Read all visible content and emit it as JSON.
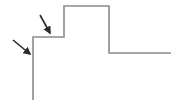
{
  "diagram": {
    "width": 183,
    "height": 109,
    "background": "#ffffff",
    "step_path": {
      "points": "33,100 33,37 64,37 64,6 109,6 109,53 171,53",
      "stroke": "#8a8a8a",
      "stroke_width": 1.6
    },
    "arrows": [
      {
        "x1": 13,
        "y1": 40,
        "x2": 30,
        "y2": 54,
        "color": "#2a2a2a"
      },
      {
        "x1": 40,
        "y1": 15,
        "x2": 50,
        "y2": 33,
        "color": "#2a2a2a"
      }
    ]
  }
}
